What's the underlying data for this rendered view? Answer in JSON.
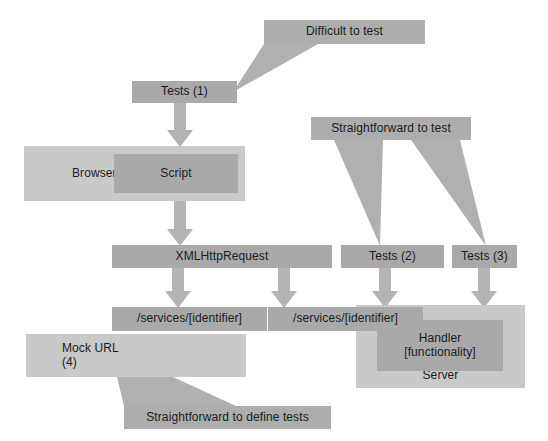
{
  "diagram": {
    "colors": {
      "box_dark": "#a9a9a9",
      "box_light": "#c9c9c9",
      "box_mid": "#b0b0b0",
      "callout": "#adadad",
      "arrow": "#b4b4b4",
      "text": "#1b1b1b",
      "background": "#ffffff"
    },
    "callouts": [
      {
        "id": "difficult-to-test",
        "label": "Difficult to test"
      },
      {
        "id": "straightforward-to-test",
        "label": "Straightforward to test"
      },
      {
        "id": "straightforward-to-define-tests",
        "label": "Straightforward to define tests"
      }
    ],
    "nodes": [
      {
        "id": "tests-1",
        "label": "Tests (1)"
      },
      {
        "id": "browser",
        "label": "Browser"
      },
      {
        "id": "script",
        "label": "Script"
      },
      {
        "id": "xmlhttprequest",
        "label": "XMLHttpRequest"
      },
      {
        "id": "tests-2",
        "label": "Tests (2)"
      },
      {
        "id": "tests-3",
        "label": "Tests (3)"
      },
      {
        "id": "services-identifier-left",
        "label": "/services/[identifier]"
      },
      {
        "id": "services-identifier-right",
        "label": "/services/[identifier]"
      },
      {
        "id": "mock-url",
        "label": "Mock URL\n(4)"
      },
      {
        "id": "mock-url-line1",
        "label": "Mock URL"
      },
      {
        "id": "mock-url-line2",
        "label": "(4)"
      },
      {
        "id": "handler",
        "label": "Handler\n[functionality]"
      },
      {
        "id": "handler-line1",
        "label": "Handler"
      },
      {
        "id": "handler-line2",
        "label": "[functionality]"
      },
      {
        "id": "server",
        "label": "Server"
      }
    ],
    "arrows": [
      {
        "id": "tests1-to-script",
        "from": "tests-1",
        "to": "script"
      },
      {
        "id": "script-to-xhr",
        "from": "script",
        "to": "xmlhttprequest"
      },
      {
        "id": "xhr-to-services-left",
        "from": "xmlhttprequest",
        "to": "services-identifier-left"
      },
      {
        "id": "xhr-to-services-right",
        "from": "xmlhttprequest",
        "to": "services-identifier-right"
      },
      {
        "id": "tests2-to-services-right",
        "from": "tests-2",
        "to": "services-identifier-right"
      },
      {
        "id": "tests3-to-handler",
        "from": "tests-3",
        "to": "handler"
      }
    ]
  }
}
